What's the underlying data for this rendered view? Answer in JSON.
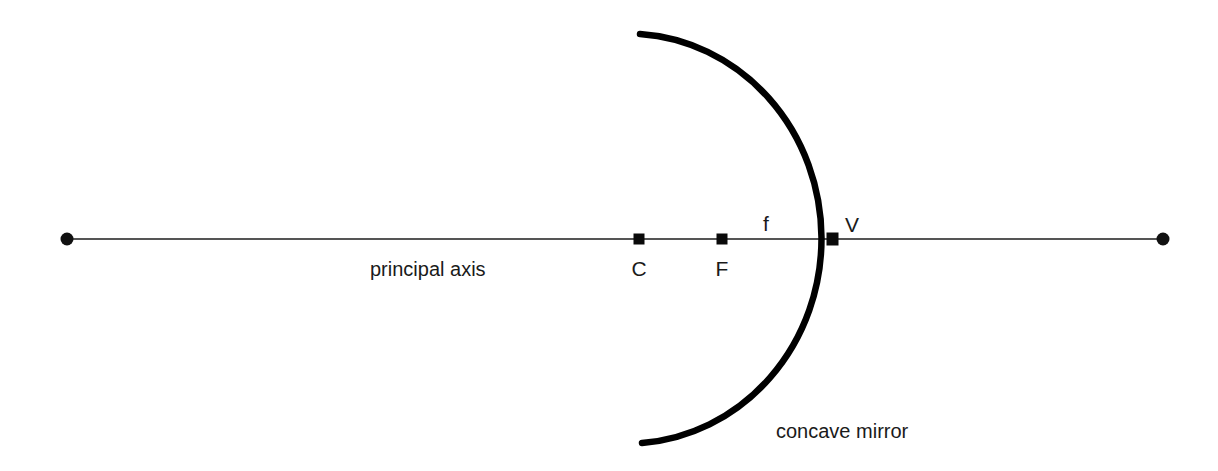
{
  "diagram": {
    "background_color": "#ffffff",
    "axis": {
      "label": "principal axis",
      "color": "#555555",
      "y": 239,
      "x_start": 67,
      "x_end": 1163,
      "thickness": 2
    },
    "mirror": {
      "label": "concave mirror",
      "color": "#000000",
      "thickness": 6,
      "center_x": 640,
      "center_y": 239,
      "radius_x": 194,
      "radius_y": 205,
      "top_end": {
        "x": 640,
        "y": 34
      },
      "bottom_end": {
        "x": 642,
        "y": 443
      }
    },
    "points": [
      {
        "id": "center-of-curvature",
        "label": "C",
        "x": 639,
        "y": 239,
        "marker": "square"
      },
      {
        "id": "focal-point",
        "label": "F",
        "x": 722,
        "y": 239,
        "marker": "square"
      },
      {
        "id": "vertex",
        "label": "V",
        "x": 832,
        "y": 239,
        "marker": "square"
      }
    ],
    "endpoints": [
      {
        "id": "axis-left-endpoint",
        "x": 67,
        "y": 239,
        "marker": "dot",
        "radius": 6
      },
      {
        "id": "axis-right-endpoint",
        "x": 1163,
        "y": 239,
        "marker": "dot",
        "radius": 6
      }
    ],
    "measurements": [
      {
        "id": "focal-length",
        "label": "f",
        "from": "F",
        "to": "V",
        "x": 765,
        "y": 230
      }
    ],
    "labels": {
      "c": "C",
      "f_point": "F",
      "v": "V",
      "focal_length": "f",
      "principal_axis": "principal axis",
      "concave_mirror": "concave mirror"
    }
  }
}
